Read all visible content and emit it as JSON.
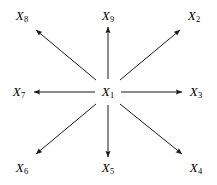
{
  "figure": {
    "type": "radial-star-directed-graph",
    "width": 217,
    "height": 185,
    "background_color": "#ffffff",
    "stroke_color": "#1a1a1a"
  },
  "center_node": {
    "id": "X1",
    "var": "X",
    "sub": "1",
    "x": 108,
    "y": 92
  },
  "nodes": [
    {
      "id": "X8",
      "var": "X",
      "sub": "8",
      "x": 22,
      "y": 16,
      "direction": "northwest"
    },
    {
      "id": "X9",
      "var": "X",
      "sub": "9",
      "x": 108,
      "y": 16,
      "direction": "north"
    },
    {
      "id": "X2",
      "var": "X",
      "sub": "2",
      "x": 194,
      "y": 16,
      "direction": "northeast"
    },
    {
      "id": "X7",
      "var": "X",
      "sub": "7",
      "x": 19,
      "y": 92,
      "direction": "west"
    },
    {
      "id": "X3",
      "var": "X",
      "sub": "3",
      "x": 196,
      "y": 92,
      "direction": "east"
    },
    {
      "id": "X6",
      "var": "X",
      "sub": "6",
      "x": 22,
      "y": 168,
      "direction": "southwest"
    },
    {
      "id": "X5",
      "var": "X",
      "sub": "5",
      "x": 108,
      "y": 168,
      "direction": "south"
    },
    {
      "id": "X4",
      "var": "X",
      "sub": "4",
      "x": 196,
      "y": 168,
      "direction": "southeast"
    }
  ],
  "edges": [
    {
      "from": "X1",
      "to": "X8",
      "x1": 96,
      "y1": 80,
      "x2": 36,
      "y2": 30
    },
    {
      "from": "X1",
      "to": "X9",
      "x1": 108,
      "y1": 79,
      "x2": 108,
      "y2": 27
    },
    {
      "from": "X1",
      "to": "X2",
      "x1": 120,
      "y1": 80,
      "x2": 180,
      "y2": 30
    },
    {
      "from": "X1",
      "to": "X7",
      "x1": 95,
      "y1": 92,
      "x2": 34,
      "y2": 92
    },
    {
      "from": "X1",
      "to": "X3",
      "x1": 121,
      "y1": 92,
      "x2": 182,
      "y2": 92
    },
    {
      "from": "X1",
      "to": "X6",
      "x1": 96,
      "y1": 104,
      "x2": 36,
      "y2": 154
    },
    {
      "from": "X1",
      "to": "X5",
      "x1": 108,
      "y1": 105,
      "x2": 108,
      "y2": 157
    },
    {
      "from": "X1",
      "to": "X4",
      "x1": 120,
      "y1": 104,
      "x2": 182,
      "y2": 154
    }
  ]
}
